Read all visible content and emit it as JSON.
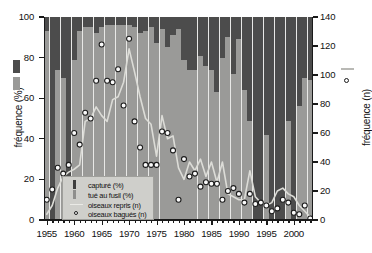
{
  "axes": {
    "y_left_title": "fréquence (%)",
    "y_right_title": "fréquence (n)",
    "y_left_ticks": [
      "0",
      "20",
      "40",
      "60",
      "80",
      "100"
    ],
    "y_right_ticks": [
      "0",
      "20",
      "40",
      "60",
      "80",
      "100",
      "120",
      "140"
    ],
    "x_ticks": [
      "1955",
      "1960",
      "1965",
      "1970",
      "1975",
      "1980",
      "1985",
      "1990",
      "1995",
      "2000"
    ]
  },
  "legend": {
    "items": [
      {
        "label": "capturé (%)",
        "marker": "dark-bar-swatch"
      },
      {
        "label": "tué au fusil (%)",
        "marker": "grey-bar-swatch"
      },
      {
        "label": "oiseaux repris (n)",
        "marker": "line-swatch"
      },
      {
        "label": "oiseaux bagués (n)",
        "marker": "circle-swatch"
      }
    ]
  },
  "colors": {
    "captured_bar": "#4c4c4c",
    "shot_bar": "#9a9a98",
    "plot_background": "#e8e8e6",
    "line": "#d9d9d4",
    "marker_fill": "#fafafa",
    "marker_edge": "#1b1b1b",
    "axis": "#1a1a1a",
    "legend_background": "#cfcfcb"
  },
  "chart_data": {
    "type": "bar",
    "title": "",
    "xlabel": "",
    "ylabel": "fréquence (%)",
    "ylabel_secondary": "fréquence (n)",
    "xlim": [
      1954.5,
      2003.5
    ],
    "ylim": [
      0,
      100
    ],
    "ylim_secondary": [
      0,
      140
    ],
    "grid": false,
    "legend_position": "inside-bottom-left",
    "x": [
      1955,
      1956,
      1957,
      1958,
      1959,
      1960,
      1961,
      1962,
      1963,
      1964,
      1965,
      1966,
      1967,
      1968,
      1969,
      1970,
      1971,
      1972,
      1973,
      1974,
      1975,
      1976,
      1977,
      1978,
      1979,
      1980,
      1981,
      1982,
      1983,
      1984,
      1985,
      1986,
      1987,
      1988,
      1989,
      1990,
      1991,
      1992,
      1993,
      1994,
      1995,
      1996,
      1997,
      1998,
      1999,
      2000,
      2001,
      2002,
      2003
    ],
    "series": [
      {
        "name": "capturé (%)",
        "axis": "left",
        "type": "bar-stacked-top",
        "values": [
          7,
          100,
          26,
          30,
          100,
          21,
          7,
          5,
          5,
          8,
          5,
          4,
          4,
          4,
          4,
          4,
          5,
          8,
          7,
          5,
          13,
          6,
          15,
          9,
          6,
          21,
          26,
          26,
          19,
          24,
          26,
          37,
          20,
          10,
          28,
          11,
          36,
          51,
          100,
          100,
          58,
          100,
          100,
          100,
          51,
          100,
          44,
          30,
          31
        ]
      },
      {
        "name": "tué au fusil (%)",
        "axis": "left",
        "type": "bar-stacked-bottom",
        "values": [
          93,
          0,
          74,
          70,
          0,
          79,
          93,
          95,
          95,
          92,
          95,
          96,
          96,
          96,
          96,
          96,
          95,
          92,
          93,
          95,
          87,
          94,
          85,
          91,
          94,
          79,
          74,
          74,
          81,
          76,
          74,
          63,
          80,
          90,
          72,
          89,
          64,
          49,
          0,
          0,
          42,
          0,
          0,
          0,
          49,
          0,
          56,
          70,
          69
        ]
      },
      {
        "name": "oiseaux repris (n)",
        "axis": "right",
        "type": "line",
        "values": [
          4,
          10,
          22,
          30,
          33,
          35,
          38,
          68,
          70,
          78,
          72,
          68,
          83,
          85,
          95,
          118,
          102,
          85,
          70,
          66,
          44,
          72,
          56,
          58,
          36,
          28,
          40,
          34,
          42,
          30,
          40,
          26,
          40,
          18,
          16,
          14,
          14,
          34,
          16,
          12,
          10,
          12,
          20,
          22,
          18,
          16,
          10,
          6,
          2
        ]
      },
      {
        "name": "oiseaux bagués (n)",
        "axis": "right",
        "type": "scatter",
        "values": [
          14,
          21,
          36,
          32,
          38,
          60,
          52,
          74,
          70,
          96,
          121,
          96,
          95,
          104,
          79,
          125,
          68,
          50,
          38,
          38,
          38,
          61,
          60,
          48,
          14,
          42,
          30,
          32,
          23,
          26,
          25,
          25,
          14,
          20,
          22,
          18,
          12,
          18,
          11,
          12,
          10,
          6,
          8,
          14,
          12,
          5,
          4,
          10,
          1
        ]
      }
    ]
  }
}
